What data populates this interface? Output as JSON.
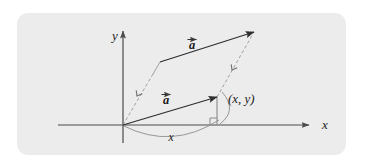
{
  "figure": {
    "panel": {
      "fill_color": "#ececec",
      "x": 17,
      "y": 13,
      "width": 329,
      "height": 142,
      "corner_radius": 11
    },
    "stroke_colors": {
      "axis": "#4a4a4a",
      "vector": "#3a3a3a",
      "dashed": "#9a9a9a",
      "arc": "#7d7d7d",
      "drop_line": "#8a8a8a",
      "text": "#1a1a1a"
    },
    "axes": {
      "origin": {
        "x": 123,
        "y": 125
      },
      "x_axis": {
        "label": "x",
        "label_x": 322,
        "label_y": 129,
        "start_x": 58,
        "end_x": 309,
        "y": 125
      },
      "y_axis": {
        "label": "y",
        "label_x": 112,
        "label_y": 40,
        "x": 123,
        "start_y": 143,
        "end_y": 31
      }
    },
    "vectors": [
      {
        "name": "vector-a-lower",
        "label": "a",
        "accent": "arrow",
        "label_x": 163,
        "label_y": 104,
        "tail_x": 123,
        "tail_y": 125,
        "tip_x": 217,
        "tip_y": 97
      },
      {
        "name": "vector-a-upper",
        "label": "a",
        "accent": "arrow",
        "label_x": 189,
        "label_y": 49,
        "tail_x": 160,
        "tail_y": 62,
        "tip_x": 254,
        "tip_y": 32
      }
    ],
    "dashed_lines": [
      {
        "name": "dashed-line-left",
        "from_x": 123,
        "from_y": 125,
        "to_x": 160,
        "to_y": 62,
        "marker_x": 137,
        "marker_y": 96
      },
      {
        "name": "dashed-line-right",
        "from_x": 217,
        "from_y": 97,
        "to_x": 254,
        "to_y": 32,
        "marker_x": 232,
        "marker_y": 70
      }
    ],
    "point_label": {
      "text": "(x,  y)",
      "x": 228,
      "y": 103
    },
    "drop_line": {
      "from_x": 217,
      "from_y": 97,
      "to_x": 217,
      "to_y": 125
    },
    "right_angle_marker": {
      "x": 210,
      "y": 118,
      "size": 7
    },
    "arc": {
      "label": "x",
      "label_x": 171,
      "label_y": 141,
      "start_x": 124,
      "start_y": 126,
      "end_x": 219,
      "end_y": 120,
      "control_x": 172,
      "control_y": 150
    },
    "point_arc": {
      "start_x": 222,
      "start_y": 92,
      "end_x": 220,
      "end_y": 124,
      "control_x": 238,
      "control_y": 110
    }
  }
}
